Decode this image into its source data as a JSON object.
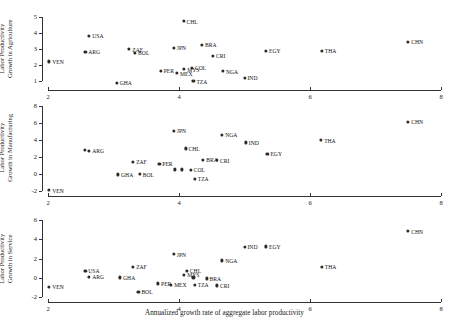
{
  "figure": {
    "xlabel": "Annualized growth rate of aggregate labor productivity",
    "xticks": [
      "2",
      "4",
      "6",
      "8"
    ],
    "xlim": [
      2,
      8
    ]
  },
  "chart_data": [
    {
      "type": "scatter",
      "title": "",
      "panel": "agriculture",
      "ylabel": "Labor Productivity\nGrowth in Agriculture",
      "ylabel_line1": "Labor Productivity",
      "ylabel_line2": "Growth in Agriculture",
      "xlabel": "",
      "xlim": [
        2,
        8
      ],
      "ylim": [
        0.55,
        5.3
      ],
      "yticks": [
        "1",
        "2",
        "3",
        "4",
        "5"
      ],
      "ytickvals": [
        1,
        2,
        3,
        4,
        5
      ],
      "grid": false,
      "legend": "none",
      "points": [
        {
          "label": "VEN",
          "x": 2.02,
          "y": 2.21,
          "lpos": "right"
        },
        {
          "label": "USA",
          "x": 2.63,
          "y": 3.82,
          "lpos": "right"
        },
        {
          "label": "ARG",
          "x": 2.57,
          "y": 2.81,
          "lpos": "right"
        },
        {
          "label": "GHA",
          "x": 3.05,
          "y": 0.86,
          "lpos": "right"
        },
        {
          "label": "ZAF",
          "x": 3.24,
          "y": 2.98,
          "lpos": "right"
        },
        {
          "label": "BOL",
          "x": 3.33,
          "y": 2.74,
          "lpos": "right"
        },
        {
          "label": "PER",
          "x": 3.72,
          "y": 1.62,
          "lpos": "right"
        },
        {
          "label": "JPN",
          "x": 3.92,
          "y": 3.05,
          "lpos": "right"
        },
        {
          "label": "MEX",
          "x": 3.97,
          "y": 1.48,
          "lpos": "right"
        },
        {
          "label": "MYS",
          "x": 4.08,
          "y": 1.72,
          "lpos": "right"
        },
        {
          "label": "CHL",
          "x": 4.07,
          "y": 4.73,
          "lpos": "right"
        },
        {
          "label": "COL",
          "x": 4.2,
          "y": 1.8,
          "lpos": "right"
        },
        {
          "label": "BRA",
          "x": 4.35,
          "y": 3.25,
          "lpos": "right"
        },
        {
          "label": "TZA",
          "x": 4.22,
          "y": 0.98,
          "lpos": "right"
        },
        {
          "label": "CRI",
          "x": 4.52,
          "y": 2.58,
          "lpos": "right"
        },
        {
          "label": "NGA",
          "x": 4.67,
          "y": 1.6,
          "lpos": "right"
        },
        {
          "label": "IND",
          "x": 5.0,
          "y": 1.18,
          "lpos": "right"
        },
        {
          "label": "EGY",
          "x": 5.33,
          "y": 2.88,
          "lpos": "right"
        },
        {
          "label": "THA",
          "x": 6.18,
          "y": 2.87,
          "lpos": "right"
        },
        {
          "label": "CHN",
          "x": 7.5,
          "y": 3.45,
          "lpos": "right"
        }
      ]
    },
    {
      "type": "scatter",
      "title": "",
      "panel": "manufacturing",
      "ylabel": "Labor Productivity\nGrowth in Manufacturing",
      "ylabel_line1": "Labor Productivity",
      "ylabel_line2": "Growth in Manufacturing",
      "xlabel": "",
      "xlim": [
        2,
        8
      ],
      "ylim": [
        -2.4,
        6.6
      ],
      "yticks": [
        "-2",
        "0",
        "2",
        "4",
        "6",
        "8"
      ],
      "ytickvals": [
        -2,
        0,
        2,
        4,
        6,
        8
      ],
      "grid": false,
      "legend": "none",
      "points": [
        {
          "label": "VEN",
          "x": 2.02,
          "y": -1.95,
          "lpos": "right"
        },
        {
          "label": "USA",
          "x": 2.56,
          "y": 2.78,
          "lpos": "none"
        },
        {
          "label": "ARG",
          "x": 2.63,
          "y": 2.72,
          "lpos": "right"
        },
        {
          "label": "GHA",
          "x": 3.07,
          "y": -0.08,
          "lpos": "right"
        },
        {
          "label": "ZAF",
          "x": 3.3,
          "y": 1.42,
          "lpos": "right"
        },
        {
          "label": "BOL",
          "x": 3.4,
          "y": -0.05,
          "lpos": "right"
        },
        {
          "label": "PER",
          "x": 3.7,
          "y": 1.15,
          "lpos": "right"
        },
        {
          "label": "MEX",
          "x": 3.94,
          "y": 0.52,
          "lpos": "none"
        },
        {
          "label": "JPN",
          "x": 3.92,
          "y": 5.05,
          "lpos": "right"
        },
        {
          "label": "MYS",
          "x": 4.05,
          "y": 0.52,
          "lpos": "none"
        },
        {
          "label": "CHL",
          "x": 4.1,
          "y": 3.0,
          "lpos": "right"
        },
        {
          "label": "COL",
          "x": 4.18,
          "y": 0.48,
          "lpos": "right"
        },
        {
          "label": "TZA",
          "x": 4.24,
          "y": -0.62,
          "lpos": "right"
        },
        {
          "label": "BRA",
          "x": 4.37,
          "y": 1.62,
          "lpos": "right"
        },
        {
          "label": "CRI",
          "x": 4.58,
          "y": 1.6,
          "lpos": "right"
        },
        {
          "label": "NGA",
          "x": 4.66,
          "y": 4.62,
          "lpos": "right"
        },
        {
          "label": "IND",
          "x": 5.02,
          "y": 3.7,
          "lpos": "right"
        },
        {
          "label": "EGY",
          "x": 5.35,
          "y": 2.35,
          "lpos": "right"
        },
        {
          "label": "THA",
          "x": 6.17,
          "y": 3.98,
          "lpos": "right"
        },
        {
          "label": "CHN",
          "x": 7.5,
          "y": 6.15,
          "lpos": "right"
        }
      ]
    },
    {
      "type": "scatter",
      "title": "",
      "panel": "service",
      "ylabel": "Labor Productivity\nGrowth in Service",
      "ylabel_line1": "Labor Productivity",
      "ylabel_line2": "Growth in Service",
      "xlabel": "Annualized growth rate of aggregate labor productivity",
      "xlim": [
        2,
        8
      ],
      "ylim": [
        -2.3,
        5.6
      ],
      "yticks": [
        "-2",
        "0",
        "2",
        "4",
        "6"
      ],
      "ytickvals": [
        -2,
        0,
        2,
        4,
        6
      ],
      "grid": false,
      "legend": "none",
      "points": [
        {
          "label": "VEN",
          "x": 2.02,
          "y": -0.95,
          "lpos": "right"
        },
        {
          "label": "USA",
          "x": 2.57,
          "y": 0.72,
          "lpos": "right"
        },
        {
          "label": "ARG",
          "x": 2.63,
          "y": 0.1,
          "lpos": "right"
        },
        {
          "label": "GHA",
          "x": 3.1,
          "y": 0.05,
          "lpos": "right"
        },
        {
          "label": "ZAF",
          "x": 3.3,
          "y": 1.18,
          "lpos": "right"
        },
        {
          "label": "BOL",
          "x": 3.38,
          "y": -1.42,
          "lpos": "right"
        },
        {
          "label": "PER",
          "x": 3.68,
          "y": -0.58,
          "lpos": "right"
        },
        {
          "label": "MEX",
          "x": 3.88,
          "y": -0.7,
          "lpos": "right"
        },
        {
          "label": "JPN",
          "x": 3.92,
          "y": 2.45,
          "lpos": "right"
        },
        {
          "label": "CHL",
          "x": 4.12,
          "y": 0.72,
          "lpos": "right"
        },
        {
          "label": "MYS",
          "x": 4.08,
          "y": 0.35,
          "lpos": "right"
        },
        {
          "label": "COL",
          "x": 4.22,
          "y": 0.05,
          "lpos": "none"
        },
        {
          "label": "TZA",
          "x": 4.24,
          "y": -0.72,
          "lpos": "right"
        },
        {
          "label": "BRA",
          "x": 4.42,
          "y": -0.05,
          "lpos": "right"
        },
        {
          "label": "CRI",
          "x": 4.58,
          "y": -0.78,
          "lpos": "right"
        },
        {
          "label": "NGA",
          "x": 4.66,
          "y": 1.82,
          "lpos": "right"
        },
        {
          "label": "IND",
          "x": 5.0,
          "y": 3.25,
          "lpos": "right"
        },
        {
          "label": "EGY",
          "x": 5.33,
          "y": 3.28,
          "lpos": "right"
        },
        {
          "label": "THA",
          "x": 6.18,
          "y": 1.12,
          "lpos": "right"
        },
        {
          "label": "CHN",
          "x": 7.5,
          "y": 4.85,
          "lpos": "right"
        }
      ]
    }
  ]
}
